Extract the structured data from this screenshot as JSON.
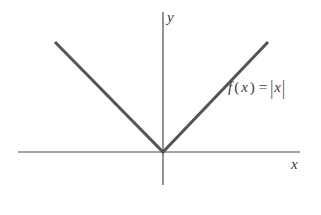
{
  "figure": {
    "background_color": "#ffffff",
    "axis_color": "#4a4a4a",
    "curve_color": "#555555",
    "text_color": "#3a3a3a"
  },
  "labels": {
    "y_axis": "y",
    "x_axis": "x",
    "function": {
      "name": "f",
      "open_paren": "(",
      "variable": "x",
      "close_paren": ")",
      "equals": "=",
      "left_bar": "|",
      "argument": "x",
      "right_bar": "|",
      "full_text": "f(x) = |x|"
    }
  },
  "chart_data": {
    "type": "line",
    "title": "",
    "subtitle": "",
    "xlabel": "x",
    "ylabel": "y",
    "function_expression": "f(x) = |x|",
    "grid": false,
    "legend": false,
    "xlim": [
      -5.2,
      6.7
    ],
    "ylim": [
      -1.6,
      5.4
    ],
    "axes": {
      "x_axis": {
        "label": "x",
        "pixel_start": [
          18,
          152
        ],
        "pixel_end": [
          300,
          152
        ],
        "origin_pixel": [
          163,
          152
        ]
      },
      "y_axis": {
        "label": "y",
        "pixel_start": [
          163,
          12
        ],
        "pixel_end": [
          163,
          185
        ],
        "origin_pixel": [
          163,
          152
        ]
      }
    },
    "series": [
      {
        "name": "f(x) = |x|",
        "color": "#555555",
        "linewidth": 3,
        "x": [
          -5.2,
          0,
          5.2
        ],
        "y": [
          5.2,
          0,
          5.2
        ],
        "pixel_points": [
          [
            55,
            42
          ],
          [
            163,
            152
          ],
          [
            268,
            42
          ]
        ],
        "vertex": [
          0,
          0
        ]
      }
    ],
    "annotations": [
      {
        "text": "f(x) = |x|",
        "pixel_position": [
          228,
          80
        ],
        "style": "italic-serif"
      }
    ]
  }
}
